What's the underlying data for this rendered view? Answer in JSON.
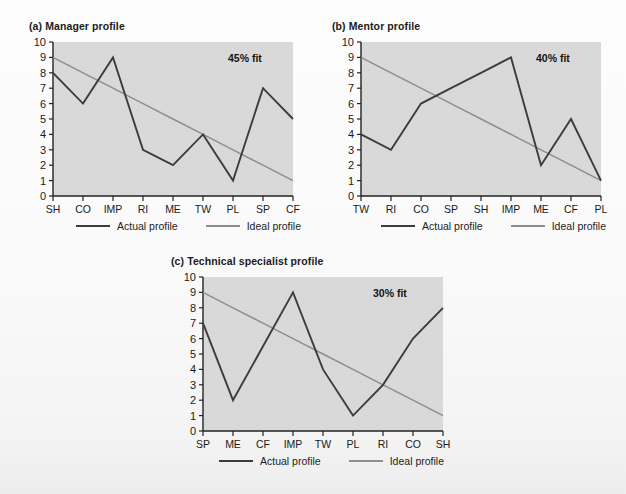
{
  "page": {
    "background_color": "#fbfbfb",
    "plot_fill_color": "#d9d9d9",
    "actual_line_color": "#3c3c3c",
    "ideal_line_color": "#8e8e8e",
    "axis_color": "#222222"
  },
  "legend": {
    "actual_label": "Actual profile",
    "ideal_label": "Ideal profile"
  },
  "y_axis": {
    "ticks": [
      "0",
      "1",
      "2",
      "3",
      "4",
      "5",
      "6",
      "7",
      "8",
      "9",
      "10"
    ],
    "min": 0,
    "max": 10
  },
  "charts": [
    {
      "id": "manager",
      "title": "(a) Manager profile",
      "fit_label": "45% fit",
      "fit_percent": 45
    },
    {
      "id": "mentor",
      "title": "(b) Mentor profile",
      "fit_label": "40% fit",
      "fit_percent": 40
    },
    {
      "id": "technical-specialist",
      "title": "(c) Technical specialist profile",
      "fit_label": "30% fit",
      "fit_percent": 30
    }
  ],
  "chart_data": [
    {
      "type": "line",
      "id": "manager",
      "title": "(a) Manager profile",
      "xlabel": "",
      "ylabel": "",
      "ylim": [
        0,
        10
      ],
      "grid": false,
      "legend_position": "bottom",
      "annotations": [
        "45% fit"
      ],
      "categories": [
        "SH",
        "CO",
        "IMP",
        "RI",
        "ME",
        "TW",
        "PL",
        "SP",
        "CF"
      ],
      "series": [
        {
          "name": "Actual profile",
          "color": "#3c3c3c",
          "values": [
            8,
            6,
            9,
            3,
            2,
            4,
            1,
            7,
            5
          ]
        },
        {
          "name": "Ideal profile",
          "color": "#8e8e8e",
          "values": [
            9,
            8,
            7,
            6,
            5,
            4,
            3,
            2,
            1
          ]
        }
      ]
    },
    {
      "type": "line",
      "id": "mentor",
      "title": "(b) Mentor profile",
      "xlabel": "",
      "ylabel": "",
      "ylim": [
        0,
        10
      ],
      "grid": false,
      "legend_position": "bottom",
      "annotations": [
        "40% fit"
      ],
      "categories": [
        "TW",
        "RI",
        "CO",
        "SP",
        "SH",
        "IMP",
        "ME",
        "CF",
        "PL"
      ],
      "series": [
        {
          "name": "Actual profile",
          "color": "#3c3c3c",
          "values": [
            4,
            3,
            6,
            7,
            8,
            9,
            2,
            5,
            1
          ]
        },
        {
          "name": "Ideal profile",
          "color": "#8e8e8e",
          "values": [
            9,
            8,
            7,
            6,
            5,
            4,
            3,
            2,
            1
          ]
        }
      ]
    },
    {
      "type": "line",
      "id": "technical-specialist",
      "title": "(c) Technical specialist profile",
      "xlabel": "",
      "ylabel": "",
      "ylim": [
        0,
        10
      ],
      "grid": false,
      "legend_position": "bottom",
      "annotations": [
        "30% fit"
      ],
      "categories": [
        "SP",
        "ME",
        "CF",
        "IMP",
        "TW",
        "PL",
        "RI",
        "CO",
        "SH"
      ],
      "series": [
        {
          "name": "Actual profile",
          "color": "#3c3c3c",
          "values": [
            7,
            2,
            5.5,
            9,
            4,
            1,
            3,
            6,
            8
          ]
        },
        {
          "name": "Ideal profile",
          "color": "#8e8e8e",
          "values": [
            9,
            8,
            7,
            6,
            5,
            4,
            3,
            2,
            1
          ]
        }
      ]
    }
  ]
}
